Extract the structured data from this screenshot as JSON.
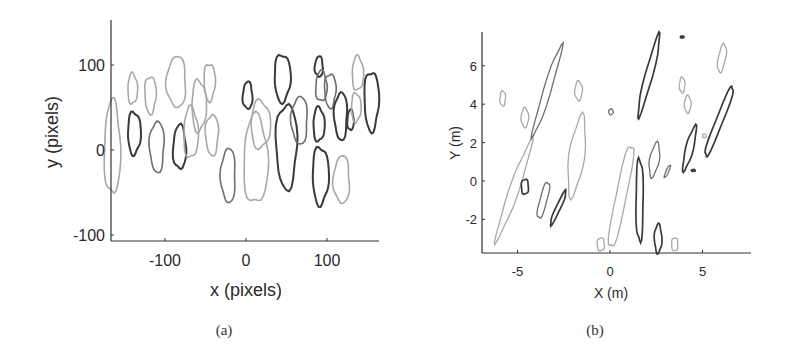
{
  "chart_data": [
    {
      "type": "scatter",
      "subtype": "contour-outlines",
      "panel_label": "(a)",
      "title": "",
      "xlabel": "x (pixels)",
      "ylabel": "y (pixels)",
      "xticks": [
        "-100",
        "0",
        "100"
      ],
      "yticks": [
        "100",
        "0",
        "-100"
      ],
      "xlim": [
        -168,
        165
      ],
      "ylim": [
        -108,
        155
      ],
      "grid": false,
      "legend": null,
      "description": "Grayscale closed blob/ellipse contours of detected objects in image-pixel coordinates",
      "blobs": [
        {
          "cx": -165,
          "cy": 2,
          "rx": 10,
          "ry": 55,
          "shade": "light"
        },
        {
          "cx": -140,
          "cy": 72,
          "rx": 6,
          "ry": 18,
          "shade": "light"
        },
        {
          "cx": -138,
          "cy": 20,
          "rx": 8,
          "ry": 25,
          "shade": "dark"
        },
        {
          "cx": -118,
          "cy": 65,
          "rx": 7,
          "ry": 22,
          "shade": "light"
        },
        {
          "cx": -110,
          "cy": 4,
          "rx": 9,
          "ry": 30,
          "shade": "mid"
        },
        {
          "cx": -86,
          "cy": 80,
          "rx": 12,
          "ry": 30,
          "shade": "light"
        },
        {
          "cx": -82,
          "cy": 3,
          "rx": 8,
          "ry": 26,
          "shade": "dark"
        },
        {
          "cx": -68,
          "cy": 20,
          "rx": 9,
          "ry": 30,
          "shade": "light"
        },
        {
          "cx": -58,
          "cy": 52,
          "rx": 9,
          "ry": 30,
          "shade": "light"
        },
        {
          "cx": -45,
          "cy": 80,
          "rx": 7,
          "ry": 22,
          "shade": "light"
        },
        {
          "cx": -42,
          "cy": 18,
          "rx": 8,
          "ry": 24,
          "shade": "light"
        },
        {
          "cx": -22,
          "cy": -30,
          "rx": 9,
          "ry": 32,
          "shade": "mid"
        },
        {
          "cx": 2,
          "cy": 64,
          "rx": 6,
          "ry": 16,
          "shade": "dark"
        },
        {
          "cx": 12,
          "cy": -12,
          "rx": 15,
          "ry": 52,
          "shade": "light"
        },
        {
          "cx": 18,
          "cy": 30,
          "rx": 12,
          "ry": 28,
          "shade": "light"
        },
        {
          "cx": 45,
          "cy": 85,
          "rx": 10,
          "ry": 28,
          "shade": "dark"
        },
        {
          "cx": 50,
          "cy": 5,
          "rx": 13,
          "ry": 50,
          "shade": "dark"
        },
        {
          "cx": 66,
          "cy": 35,
          "rx": 10,
          "ry": 28,
          "shade": "mid"
        },
        {
          "cx": 90,
          "cy": 98,
          "rx": 5,
          "ry": 12,
          "shade": "dark"
        },
        {
          "cx": 93,
          "cy": 75,
          "rx": 7,
          "ry": 18,
          "shade": "mid"
        },
        {
          "cx": 90,
          "cy": 30,
          "rx": 7,
          "ry": 20,
          "shade": "dark"
        },
        {
          "cx": 92,
          "cy": -30,
          "rx": 10,
          "ry": 34,
          "shade": "dark"
        },
        {
          "cx": 104,
          "cy": 70,
          "rx": 7,
          "ry": 20,
          "shade": "mid"
        },
        {
          "cx": 117,
          "cy": 40,
          "rx": 8,
          "ry": 28,
          "shade": "dark"
        },
        {
          "cx": 118,
          "cy": -35,
          "rx": 10,
          "ry": 28,
          "shade": "light"
        },
        {
          "cx": 129,
          "cy": 35,
          "rx": 4,
          "ry": 12,
          "shade": "dark"
        },
        {
          "cx": 138,
          "cy": 90,
          "rx": 7,
          "ry": 20,
          "shade": "light"
        },
        {
          "cx": 136,
          "cy": 50,
          "rx": 6,
          "ry": 17,
          "shade": "light"
        },
        {
          "cx": 155,
          "cy": 58,
          "rx": 9,
          "ry": 35,
          "shade": "dark"
        }
      ]
    },
    {
      "type": "scatter",
      "subtype": "contour-outlines",
      "panel_label": "(b)",
      "title": "",
      "xlabel": "X (m)",
      "ylabel": "Y (m)",
      "xticks": [
        "-5",
        "0",
        "5"
      ],
      "yticks": [
        "6",
        "4",
        "2",
        "0",
        "-2"
      ],
      "xlim": [
        -6.9,
        7.5
      ],
      "ylim": [
        -3.7,
        7.7
      ],
      "grid": false,
      "legend": null,
      "description": "Grayscale closed contours of objects projected to ground-plane metric coordinates",
      "blobs": [
        {
          "cx": -5.8,
          "cy": 4.3,
          "len": 0.8,
          "wid": 0.3,
          "angle": 0,
          "shade": "light"
        },
        {
          "cx": -4.6,
          "cy": 3.3,
          "len": 1.0,
          "wid": 0.4,
          "angle": 0,
          "shade": "light"
        },
        {
          "cx": -5.2,
          "cy": -0.5,
          "len": 5.5,
          "wid": 0.5,
          "angle": 20,
          "shade": "light"
        },
        {
          "cx": -3.4,
          "cy": 4.7,
          "len": 5.0,
          "wid": 0.4,
          "angle": 18,
          "shade": "mid"
        },
        {
          "cx": -4.6,
          "cy": -0.3,
          "len": 0.8,
          "wid": 0.4,
          "angle": 0,
          "shade": "dark"
        },
        {
          "cx": -3.6,
          "cy": -1.0,
          "len": 2.0,
          "wid": 0.4,
          "angle": 15,
          "shade": "mid"
        },
        {
          "cx": -2.8,
          "cy": -1.4,
          "len": 2.0,
          "wid": 0.25,
          "angle": 25,
          "shade": "dark"
        },
        {
          "cx": -1.7,
          "cy": 4.7,
          "len": 1.0,
          "wid": 0.4,
          "angle": 0,
          "shade": "light"
        },
        {
          "cx": -1.8,
          "cy": 1.3,
          "len": 4.2,
          "wid": 0.8,
          "angle": 8,
          "shade": "light"
        },
        {
          "cx": 0.05,
          "cy": 3.6,
          "len": 0.3,
          "wid": 0.25,
          "angle": 0,
          "shade": "mid"
        },
        {
          "cx": -0.5,
          "cy": -3.3,
          "len": 0.7,
          "wid": 0.4,
          "angle": 0,
          "shade": "light"
        },
        {
          "cx": 0.6,
          "cy": -0.8,
          "len": 5.7,
          "wid": 0.6,
          "angle": 12,
          "shade": "light"
        },
        {
          "cx": 1.6,
          "cy": -1.0,
          "len": 4.4,
          "wid": 0.4,
          "angle": 0,
          "shade": "dark"
        },
        {
          "cx": 2.1,
          "cy": 5.5,
          "len": 4.4,
          "wid": 0.4,
          "angle": 15,
          "shade": "dark"
        },
        {
          "cx": 2.4,
          "cy": 1.1,
          "len": 1.8,
          "wid": 0.5,
          "angle": 10,
          "shade": "mid"
        },
        {
          "cx": 2.6,
          "cy": -3.0,
          "len": 1.5,
          "wid": 0.4,
          "angle": 0,
          "shade": "dark"
        },
        {
          "cx": 3.1,
          "cy": 0.5,
          "len": 0.7,
          "wid": 0.15,
          "angle": 25,
          "shade": "mid"
        },
        {
          "cx": 3.5,
          "cy": -3.3,
          "len": 0.7,
          "wid": 0.35,
          "angle": 0,
          "shade": "light"
        },
        {
          "cx": 3.9,
          "cy": 7.5,
          "len": 0.1,
          "wid": 0.2,
          "angle": 0,
          "shade": "dark"
        },
        {
          "cx": 3.9,
          "cy": 5.0,
          "len": 0.8,
          "wid": 0.3,
          "angle": 0,
          "shade": "light"
        },
        {
          "cx": 4.2,
          "cy": 4.0,
          "len": 0.9,
          "wid": 0.35,
          "angle": 0,
          "shade": "light"
        },
        {
          "cx": 4.3,
          "cy": 1.7,
          "len": 2.4,
          "wid": 0.4,
          "angle": 15,
          "shade": "dark"
        },
        {
          "cx": 4.5,
          "cy": 0.55,
          "len": 0.1,
          "wid": 0.2,
          "angle": 0,
          "shade": "dark"
        },
        {
          "cx": 5.1,
          "cy": 2.35,
          "len": 0.2,
          "wid": 0.2,
          "angle": 0,
          "shade": "light"
        },
        {
          "cx": 5.9,
          "cy": 3.1,
          "len": 4.1,
          "wid": 0.4,
          "angle": 22,
          "shade": "dark"
        },
        {
          "cx": 6.05,
          "cy": 6.4,
          "len": 1.5,
          "wid": 0.4,
          "angle": 10,
          "shade": "light"
        }
      ]
    }
  ],
  "captions": {
    "a": "(a)",
    "b": "(b)"
  },
  "colors": {
    "dark": "#3a3a3a",
    "mid": "#6e6e6e",
    "light": "#a8a8a8",
    "axis": "#333333"
  }
}
